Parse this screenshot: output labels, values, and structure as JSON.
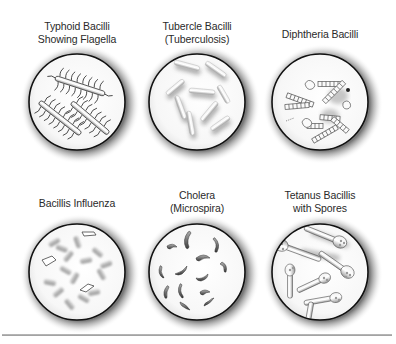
{
  "diagram": {
    "panels": [
      {
        "id": "typhoid",
        "label_lines": [
          "Typhoid Bacilli",
          "Showing Flagella"
        ],
        "shape": "rods-with-flagella",
        "cx": 77,
        "cy": 102
      },
      {
        "id": "tubercle",
        "label_lines": [
          "Tubercle Bacilli",
          "(Tuberculosis)"
        ],
        "shape": "slender-rods",
        "cx": 197,
        "cy": 102
      },
      {
        "id": "diphtheria",
        "label_lines": [
          "Diphtheria Bacilli"
        ],
        "shape": "segmented-rods",
        "cx": 320,
        "cy": 102
      },
      {
        "id": "influenza",
        "label_lines": [
          "Bacillis Influenza"
        ],
        "shape": "short-rods-clusters",
        "cx": 77,
        "cy": 272
      },
      {
        "id": "cholera",
        "label_lines": [
          "Cholera",
          "(Microspira)"
        ],
        "shape": "comma-shaped",
        "cx": 197,
        "cy": 272
      },
      {
        "id": "tetanus",
        "label_lines": [
          "Tetanus Bacillis",
          "with Spores"
        ],
        "shape": "drumstick-with-spores",
        "cx": 320,
        "cy": 272
      }
    ],
    "colors": {
      "circle_border": "#111111",
      "shadow": "#8a8a8a",
      "rule": "#a8a8a8"
    }
  }
}
